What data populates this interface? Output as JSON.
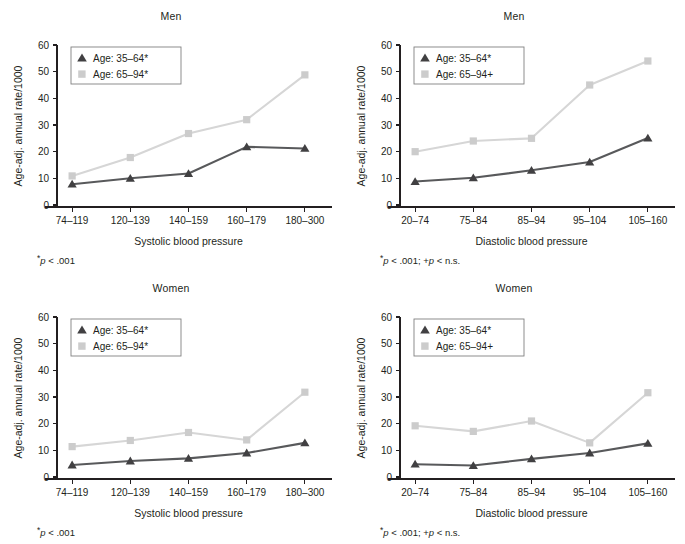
{
  "figure": {
    "background": "#ffffff",
    "dark_color": "#58595b",
    "dark_marker_color": "#414042",
    "light_color": "#d6d6d6",
    "light_marker_color": "#cccccc",
    "axis_color": "#231f20"
  },
  "panels": [
    {
      "id": "men-systolic",
      "title": "Men",
      "footnote_prefix": "*",
      "footnote_text": "p",
      "footnote_suffix": " < .001",
      "legend": {
        "items": [
          {
            "marker": "triangle-marker",
            "label": "Age: 35–64*"
          },
          {
            "marker": "square-marker",
            "label": "Age: 65–94*"
          }
        ]
      },
      "chart_data": {
        "type": "line",
        "title": "Men",
        "xlabel": "Systolic blood pressure",
        "ylabel": "Age-adj. annual rate/1000",
        "categories": [
          "74–119",
          "120–139",
          "140–159",
          "160–179",
          "180–300"
        ],
        "ylim": [
          0,
          60
        ],
        "yticks": [
          0,
          10,
          20,
          30,
          40,
          50,
          60
        ],
        "grid": false,
        "legend_position": "upper-left",
        "series": [
          {
            "name": "Age: 35–64*",
            "marker": "triangle",
            "color": "#58595b",
            "values": [
              7.8,
              10.0,
              11.8,
              21.8,
              21.2
            ]
          },
          {
            "name": "Age: 65–94*",
            "marker": "square",
            "color": "#d6d6d6",
            "values": [
              10.9,
              17.8,
              26.8,
              32.0,
              48.8
            ]
          }
        ]
      }
    },
    {
      "id": "men-diastolic",
      "title": "Men",
      "footnote_prefix": "*",
      "footnote_text": "p",
      "footnote_suffix": " < .001; +",
      "footnote_text2": "p",
      "footnote_suffix2": " < n.s.",
      "legend": {
        "items": [
          {
            "marker": "triangle-marker",
            "label": "Age: 35–64*"
          },
          {
            "marker": "square-marker",
            "label": "Age: 65–94+"
          }
        ]
      },
      "chart_data": {
        "type": "line",
        "title": "Men",
        "xlabel": "Diastolic blood pressure",
        "ylabel": "Age-adj. annual rate/1000",
        "categories": [
          "20–74",
          "75–84",
          "85–94",
          "95–104",
          "105–160"
        ],
        "ylim": [
          0,
          60
        ],
        "yticks": [
          0,
          10,
          20,
          30,
          40,
          50,
          60
        ],
        "grid": false,
        "legend_position": "upper-left",
        "series": [
          {
            "name": "Age: 35–64*",
            "marker": "triangle",
            "color": "#58595b",
            "values": [
              8.8,
              10.2,
              13.0,
              16.1,
              25.1
            ]
          },
          {
            "name": "Age: 65–94+",
            "marker": "square",
            "color": "#d6d6d6",
            "values": [
              20.0,
              24.0,
              25.0,
              45.0,
              54.0
            ]
          }
        ]
      }
    },
    {
      "id": "women-systolic",
      "title": "Women",
      "footnote_prefix": "*",
      "footnote_text": "p",
      "footnote_suffix": " < .001",
      "legend": {
        "items": [
          {
            "marker": "triangle-marker",
            "label": "Age: 35–64*"
          },
          {
            "marker": "square-marker",
            "label": "Age: 65–94*"
          }
        ]
      },
      "chart_data": {
        "type": "line",
        "title": "Women",
        "xlabel": "Systolic blood pressure",
        "ylabel": "Age-adj. annual rate/1000",
        "categories": [
          "74–119",
          "120–139",
          "140–159",
          "160–179",
          "180–300"
        ],
        "ylim": [
          0,
          60
        ],
        "yticks": [
          0,
          10,
          20,
          30,
          40,
          50,
          60
        ],
        "grid": false,
        "legend_position": "upper-left",
        "series": [
          {
            "name": "Age: 35–64*",
            "marker": "triangle",
            "color": "#58595b",
            "values": [
              4.5,
              6.0,
              7.0,
              9.0,
              12.8
            ]
          },
          {
            "name": "Age: 65–94*",
            "marker": "square",
            "color": "#d6d6d6",
            "values": [
              11.4,
              13.7,
              16.7,
              13.9,
              31.8
            ]
          }
        ]
      }
    },
    {
      "id": "women-diastolic",
      "title": "Women",
      "footnote_prefix": "*",
      "footnote_text": "p",
      "footnote_suffix": " < .001; +",
      "footnote_text2": "p",
      "footnote_suffix2": " < n.s.",
      "legend": {
        "items": [
          {
            "marker": "triangle-marker",
            "label": "Age: 35–64*"
          },
          {
            "marker": "square-marker",
            "label": "Age: 65–94+"
          }
        ]
      },
      "chart_data": {
        "type": "line",
        "title": "Women",
        "xlabel": "Diastolic blood pressure",
        "ylabel": "Age-adj. annual rate/1000",
        "categories": [
          "20–74",
          "75–84",
          "85–94",
          "95–104",
          "105–160"
        ],
        "ylim": [
          0,
          60
        ],
        "yticks": [
          0,
          10,
          20,
          30,
          40,
          50,
          60
        ],
        "grid": false,
        "legend_position": "upper-left",
        "series": [
          {
            "name": "Age: 35–64*",
            "marker": "triangle",
            "color": "#58595b",
            "values": [
              4.8,
              4.3,
              6.8,
              9.0,
              12.6
            ]
          },
          {
            "name": "Age: 65–94+",
            "marker": "square",
            "color": "#d6d6d6",
            "values": [
              19.2,
              17.1,
              21.0,
              12.8,
              31.6
            ]
          }
        ]
      }
    }
  ]
}
